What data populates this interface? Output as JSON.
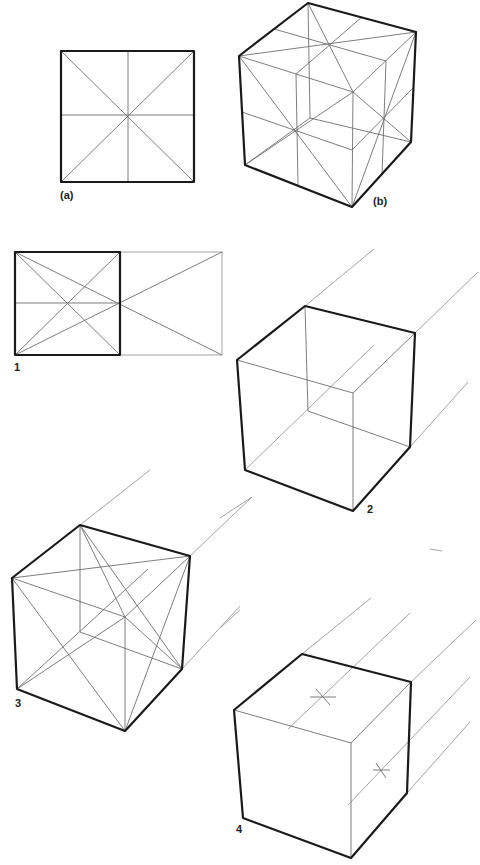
{
  "figures": {
    "a": {
      "label": "(a)",
      "description": "Square with diagonals and midlines crossing at center"
    },
    "b": {
      "label": "(b)",
      "description": "Cube with face diagonals and center lines on each visible face"
    },
    "step1": {
      "label": "1",
      "description": "Square with diagonals extended into double-width rectangle"
    },
    "step2": {
      "label": "2",
      "description": "Wireframe cube with receding parallel guidelines"
    },
    "step3": {
      "label": "3",
      "description": "Cube with diagonals on faces and receding guidelines"
    },
    "step4": {
      "label": "4",
      "description": "Cube with center marks (x) on top and side faces, extended guidelines"
    }
  },
  "colors": {
    "edge": "#1a1a1a",
    "guide": "#6e6e6e",
    "background": "#ffffff"
  }
}
